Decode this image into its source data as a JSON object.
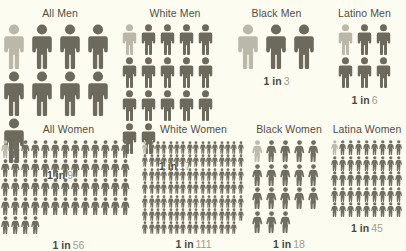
{
  "background_color": "#fdfcf1",
  "figure_color": "#6b6a5c",
  "figure_highlight_color": "#b9b8a9",
  "caption_lead_color": "#4b4a41",
  "caption_number_color": "#9d9c90",
  "chart_data": {
    "type": "pictogram",
    "title": "",
    "xlabel": "",
    "ylabel": "",
    "legend": [],
    "grid": false,
    "categories": [
      "All Men",
      "White Men",
      "Black Men",
      "Latino Men",
      "All Women",
      "White Women",
      "Black Women",
      "Latina Women"
    ],
    "values": [
      9,
      17,
      3,
      6,
      56,
      111,
      18,
      45
    ],
    "value_labels": [
      "1 in 9",
      "1 in 17",
      "1 in 3",
      "1 in 6",
      "1 in 56",
      "1 in 111",
      "1 in 18",
      "1 in 45"
    ],
    "unit": "1 icon = 1 person; 1 highlighted icon per group"
  },
  "groups": [
    {
      "title": "All Men",
      "lead": "1 in",
      "number": "9",
      "total": 9,
      "highlighted": 1,
      "per_row": 5,
      "size_class": "s-xl",
      "gender": "men"
    },
    {
      "title": "White Men",
      "lead": "1 in",
      "number": "17",
      "total": 17,
      "highlighted": 1,
      "per_row": 6,
      "size_class": "s-lg",
      "gender": "men"
    },
    {
      "title": "Black Men",
      "lead": "1 in",
      "number": "3",
      "total": 3,
      "highlighted": 1,
      "per_row": 3,
      "size_class": "s-xl",
      "gender": "men"
    },
    {
      "title": "Latino Men",
      "lead": "1 in",
      "number": "6",
      "total": 6,
      "highlighted": 1,
      "per_row": 3,
      "size_class": "s-lg",
      "gender": "men"
    },
    {
      "title": "All Women",
      "lead": "1 in",
      "number": "56",
      "total": 56,
      "highlighted": 1,
      "per_row": 14,
      "size_class": "s-sm",
      "gender": "women"
    },
    {
      "title": "White Women",
      "lead": "1 in",
      "number": "111",
      "total": 111,
      "highlighted": 1,
      "per_row": 16,
      "size_class": "s-xxs",
      "gender": "women"
    },
    {
      "title": "Black Women",
      "lead": "1 in",
      "number": "18",
      "total": 18,
      "highlighted": 1,
      "per_row": 6,
      "size_class": "s-md",
      "gender": "women"
    },
    {
      "title": "Latina Women",
      "lead": "1 in",
      "number": "45",
      "total": 45,
      "highlighted": 1,
      "per_row": 9,
      "size_class": "s-xs",
      "gender": "women"
    }
  ]
}
